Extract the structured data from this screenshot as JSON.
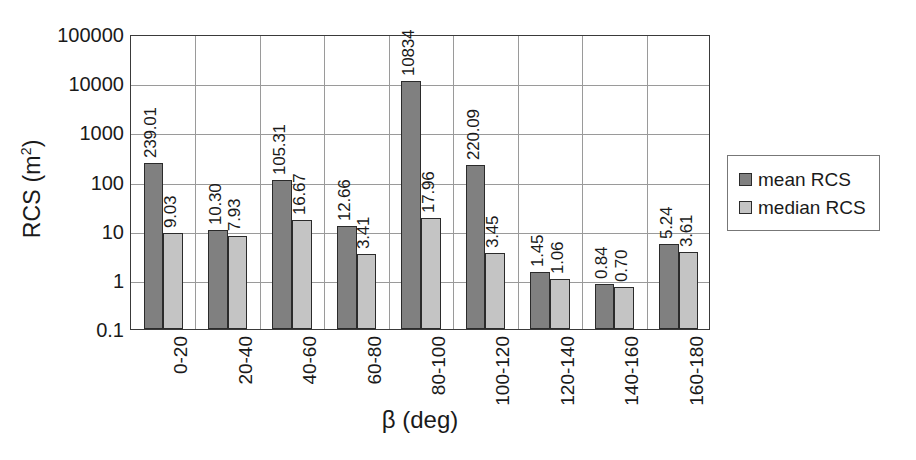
{
  "chart_data": {
    "type": "bar",
    "title": "",
    "xlabel": "β (deg)",
    "ylabel": "RCS (m²)",
    "ylabel_base": "RCS (m",
    "ylabel_exp": "2",
    "ylabel_tail": ")",
    "yscale": "log",
    "ylim": [
      0.1,
      100000
    ],
    "ytick_labels": [
      "100000",
      "10000",
      "1000",
      "100",
      "10",
      "1",
      "0.1"
    ],
    "ytick_values": [
      100000,
      10000,
      1000,
      100,
      10,
      1,
      0.1
    ],
    "grid": "both",
    "legend_position": "right",
    "categories": [
      "0-20",
      "20-40",
      "40-60",
      "60-80",
      "80-100",
      "100-120",
      "120-140",
      "140-160",
      "160-180"
    ],
    "series": [
      {
        "name": "mean RCS",
        "color": "#808080",
        "values": [
          239.01,
          10.3,
          105.31,
          12.66,
          10834,
          220.09,
          1.45,
          0.84,
          5.24
        ],
        "labels": [
          "239.01",
          "10.30",
          "105.31",
          "12.66",
          "10834",
          "220.09",
          "1.45",
          "0.84",
          "5.24"
        ]
      },
      {
        "name": "median RCS",
        "color": "#c4c4c4",
        "values": [
          9.03,
          7.93,
          16.67,
          3.41,
          17.96,
          3.45,
          1.06,
          0.7,
          3.61
        ],
        "labels": [
          "9.03",
          "7.93",
          "16.67",
          "3.41",
          "17.96",
          "3.45",
          "1.06",
          "0.70",
          "3.61"
        ]
      }
    ]
  },
  "legend": {
    "entries": [
      {
        "label": "mean RCS",
        "color": "#808080"
      },
      {
        "label": "median RCS",
        "color": "#c4c4c4"
      }
    ]
  }
}
